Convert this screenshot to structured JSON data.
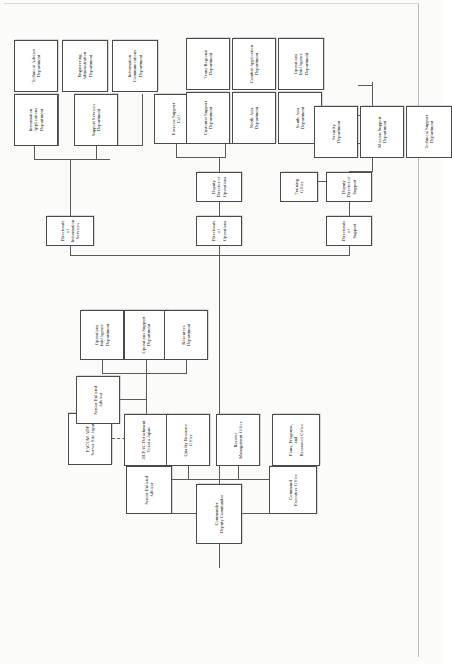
{
  "document": {
    "type": "organizational-chart",
    "orientation": "landscape-rotated-90",
    "title": "Command Organizational Chart"
  },
  "nodes": {
    "commander": "Commander\nDeputy Commander",
    "senior_enlisted_advisor_top": "Senior Enlisted\nAdvisor",
    "command_executive_office": "Command\nExecutive Office",
    "quality_resource_office": "Quality Resource\nOffice",
    "reserve_management_office": "Reserve\nManagement Office",
    "plans_programs_resources_office": "Plans, Programs,\nand\nResources Office",
    "jicpac_detachment": "JICPAC Detachment\nYokota Japan",
    "pacom_adp": "PACOM ADP\nServer Site Japan",
    "senior_enlisted_advisor_det": "Senior Enlisted\nAdvisor",
    "operations_intelligence_department_det": "Operations\nIntelligence\nDepartment",
    "operations_support_department": "Operations Support\nDepartment",
    "resources_department": "Resources\nDepartment",
    "directorate_of_information_services": "Directorate of\nInformation Services",
    "information_applications_department": "Information\nApplications\nDepartment",
    "support_services_department": "Support Services\nDepartment",
    "technical_advisor_department": "Technical Advisor\nDepartment",
    "engineering_administration_department": "Engineering\nAdministration\nDepartment",
    "information_communications_department": "Information\nCommunications\nDepartment",
    "directorate_of_operations": "Directorate of\nOperations",
    "deputy_director_of_operations": "Deputy Director of\nOperations",
    "exercise_support_cell": "Exercise Support\nCell",
    "customer_support_department": "Customer Support\nDepartment",
    "north_asia_department": "North Asia\nDepartment",
    "south_asia_department": "South Asia\nDepartment",
    "trans_regional_department": "Trans-Regional\nDepartment",
    "combat_application_department": "Combat Application\nDepartment",
    "operations_intelligence_department_ops": "Operations\nIntelligence\nDepartment",
    "directorate_of_support": "Directorate of\nSupport",
    "deputy_director_of_support": "Deputy Director of\nSupport",
    "training_office": "Training Office",
    "security_department": "Security\nDepartment",
    "mission_support_department": "Mission Support\nDepartment",
    "technical_support_department": "Technical Support\nDepartment"
  },
  "colors": {
    "page_background": "#fbfbfa",
    "box_border": "#4a4a4a",
    "box_fill": "#ffffff",
    "connector": "#5a5a5a",
    "text": "#141414"
  }
}
